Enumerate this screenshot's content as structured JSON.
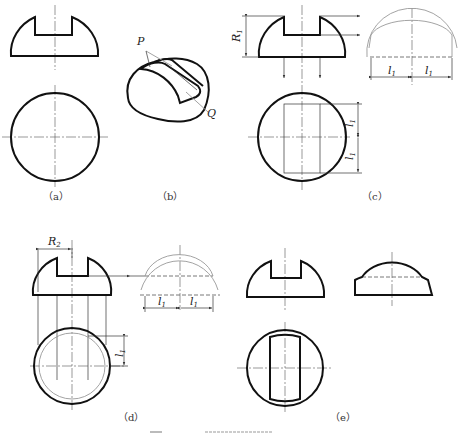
{
  "figure": {
    "panels": [
      {
        "id": "a",
        "caption": "（a）",
        "views": [
          "front",
          "top"
        ]
      },
      {
        "id": "b",
        "caption": "（b）",
        "views": [
          "isometric"
        ],
        "labels": [
          "P",
          "Q"
        ]
      },
      {
        "id": "c",
        "caption": "（c）",
        "views": [
          "front",
          "side",
          "top"
        ],
        "dimensions": [
          "R1",
          "l1",
          "l1",
          "l1",
          "l1"
        ]
      },
      {
        "id": "d",
        "caption": "（d）",
        "views": [
          "front",
          "side",
          "top"
        ],
        "dimensions": [
          "R2",
          "l1",
          "l1",
          "l1"
        ]
      },
      {
        "id": "e",
        "caption": "（e）",
        "views": [
          "front",
          "side",
          "top"
        ]
      }
    ],
    "labels": {
      "P": "P",
      "Q": "Q",
      "R1": "R",
      "R1_sub": "1",
      "R2": "R",
      "R2_sub": "2",
      "l": "l",
      "l_sub": "1"
    },
    "captions": {
      "a": "（a）",
      "b": "（b）",
      "c": "（c）",
      "d": "（d）",
      "e": "（e）"
    }
  }
}
